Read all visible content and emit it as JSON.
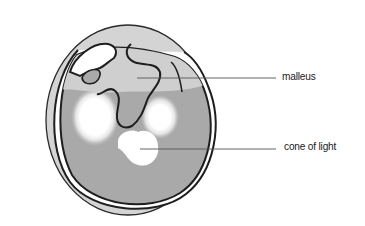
{
  "diagram": {
    "labels": [
      {
        "id": "malleus",
        "text": "malleus"
      },
      {
        "id": "cone",
        "text": "cone of light"
      }
    ],
    "colors": {
      "outer_ring": "#d4d4d4",
      "membrane_light": "#d0d0d0",
      "membrane_dark": "#a9a9a9",
      "highlight": "#ffffff",
      "outline": "#1e1e1e",
      "leader_line": "#555555"
    }
  }
}
